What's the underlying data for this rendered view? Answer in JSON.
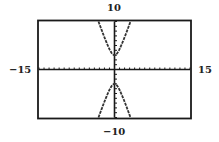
{
  "chart_data": {
    "type": "line",
    "title": "",
    "xlabel": "",
    "ylabel": "",
    "xlim": [
      -15,
      15
    ],
    "ylim": [
      -10,
      10
    ],
    "xscale": 1,
    "yscale": 1,
    "grid": false,
    "legend": null,
    "window_labels": {
      "ymax": "10",
      "ymin": "-10",
      "xmin": "-15",
      "xmax": "15"
    },
    "series": [
      {
        "name": "upper branch",
        "equation": "y^2/9 - x^2 = 1, y > 0",
        "points": [
          [
            -3.18,
            10
          ],
          [
            -2,
            7.2
          ],
          [
            -1,
            4.24
          ],
          [
            0,
            3
          ],
          [
            1,
            4.24
          ],
          [
            2,
            7.2
          ],
          [
            3.18,
            10
          ]
        ]
      },
      {
        "name": "lower branch",
        "equation": "y^2/9 - x^2 = 1, y < 0",
        "points": [
          [
            -3.18,
            -10
          ],
          [
            -2,
            -7.2
          ],
          [
            -1,
            -4.24
          ],
          [
            0,
            -3
          ],
          [
            1,
            -4.24
          ],
          [
            2,
            -7.2
          ],
          [
            3.18,
            -10
          ]
        ]
      }
    ]
  },
  "labels": {
    "top": "10",
    "bottom": "−10",
    "left": "−15",
    "right": "15"
  },
  "colors": {
    "frame": "#1a1a1a",
    "curve": "#333333",
    "axis": "#1a1a1a"
  }
}
